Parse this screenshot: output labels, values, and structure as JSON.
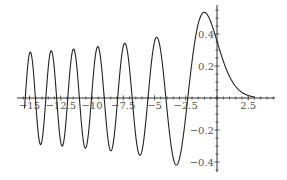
{
  "chart_data": {
    "type": "line",
    "title": "",
    "xlabel": "",
    "ylabel": "",
    "function": "Airy Ai(x)",
    "xlim": [
      -15.4,
      3.0
    ],
    "ylim": [
      -0.42,
      0.54
    ],
    "grid": false,
    "legend": null,
    "x_ticks": [
      {
        "value": -15,
        "label": "-15"
      },
      {
        "value": -12.5,
        "label": "-12.5"
      },
      {
        "value": -10,
        "label": "-10"
      },
      {
        "value": -7.5,
        "label": "-7.5"
      },
      {
        "value": -5,
        "label": "-5"
      },
      {
        "value": -2.5,
        "label": "-2.5"
      },
      {
        "value": 2.5,
        "label": "2.5"
      }
    ],
    "y_ticks": [
      {
        "value": 0.4,
        "label": "0.4"
      },
      {
        "value": 0.2,
        "label": "0.2"
      },
      {
        "value": -0.2,
        "label": "-0.2"
      },
      {
        "value": -0.4,
        "label": "-0.4"
      }
    ],
    "series": [
      {
        "name": "Ai(x)",
        "color": "#222222",
        "x": [
          -15,
          -14.5,
          -14,
          -13.5,
          -13,
          -12.5,
          -12,
          -11.5,
          -11,
          -10.5,
          -10,
          -9.5,
          -9,
          -8.5,
          -8,
          -7.5,
          -7,
          -6.5,
          -6,
          -5.5,
          -5,
          -4.5,
          -4,
          -3.5,
          -3,
          -2.5,
          -2,
          -1.5,
          -1,
          -0.5,
          0,
          0.5,
          1,
          1.5,
          2,
          2.5,
          3
        ],
        "values": [
          0.266,
          -0.106,
          -0.271,
          0.245,
          0.135,
          -0.293,
          0.245,
          -0.06,
          -0.137,
          0.278,
          -0.315,
          0.272,
          -0.151,
          -0.047,
          0.227,
          -0.354,
          0.193,
          0.102,
          -0.329,
          0.4,
          -0.24,
          -0.199,
          0.07,
          0.417,
          -0.379,
          0.053,
          0.227,
          0.464,
          0.536,
          0.476,
          0.355,
          0.231,
          0.135,
          0.072,
          0.035,
          0.016,
          0.007
        ],
        "peak": {
          "x": -1.02,
          "y": 0.536
        }
      }
    ]
  },
  "axes": {
    "x_axis_color": "#333333",
    "y_axis_color": "#333333"
  }
}
